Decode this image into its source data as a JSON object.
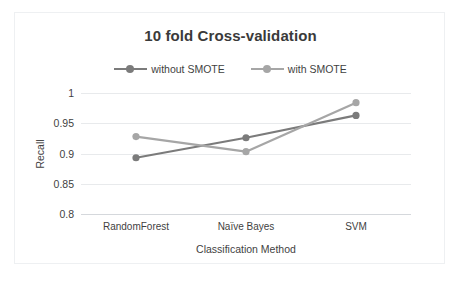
{
  "chart_data": {
    "type": "line",
    "title": "10 fold Cross-validation",
    "xlabel": "Classification Method",
    "ylabel": "Recall",
    "categories": [
      "RandomForest",
      "Naïve Bayes",
      "SVM"
    ],
    "series": [
      {
        "name": "without SMOTE",
        "values": [
          0.893,
          0.926,
          0.963
        ],
        "color": "#7b7b7b",
        "marker": "circle"
      },
      {
        "name": "with SMOTE",
        "values": [
          0.928,
          0.903,
          0.984
        ],
        "color": "#a6a6a6",
        "marker": "circle"
      }
    ],
    "ylim": [
      0.8,
      1.0
    ],
    "yticks": [
      "1",
      "0.95",
      "0.9",
      "0.85",
      "0.8"
    ],
    "ytick_values": [
      1,
      0.95,
      0.9,
      0.85,
      0.8
    ],
    "grid": true,
    "grid_axis": "y",
    "legend_position": "top",
    "plot_background": "#ffffff",
    "gridline_color": "#e8eaec",
    "text_color": "#3f3f3f"
  },
  "figure": {
    "title": "10 fold Cross-validation",
    "border_color": "#eef0f2",
    "background": "#ffffff"
  },
  "legend": {
    "items": [
      {
        "label": "without SMOTE",
        "color": "#7b7b7b"
      },
      {
        "label": "with SMOTE",
        "color": "#a6a6a6"
      }
    ]
  },
  "axes": {
    "y_title": "Recall",
    "x_title": "Classification Method",
    "y_ticks": [
      "1",
      "0.95",
      "0.9",
      "0.85",
      "0.8"
    ],
    "x_ticks": [
      "RandomForest",
      "Naïve Bayes",
      "SVM"
    ]
  }
}
